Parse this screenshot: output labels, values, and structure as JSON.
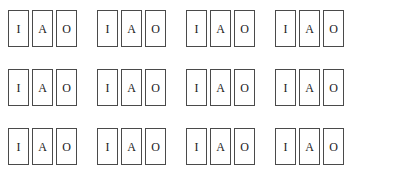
{
  "page": {
    "background_color": "#ffffff",
    "card_border_color": "#4a4a4a",
    "card_fill_color": "#ffffff",
    "letter_color": "#1a1a1a"
  },
  "grid": {
    "row_count": 3,
    "groups_per_row": 4,
    "cards_per_group": 3,
    "rows": [
      {
        "groups": [
          {
            "cards": [
              {
                "letter": "I"
              },
              {
                "letter": "A"
              },
              {
                "letter": "O"
              }
            ]
          },
          {
            "cards": [
              {
                "letter": "I"
              },
              {
                "letter": "A"
              },
              {
                "letter": "O"
              }
            ]
          },
          {
            "cards": [
              {
                "letter": "I"
              },
              {
                "letter": "A"
              },
              {
                "letter": "O"
              }
            ]
          },
          {
            "cards": [
              {
                "letter": "I"
              },
              {
                "letter": "A"
              },
              {
                "letter": "O"
              }
            ]
          }
        ]
      },
      {
        "groups": [
          {
            "cards": [
              {
                "letter": "I"
              },
              {
                "letter": "A"
              },
              {
                "letter": "O"
              }
            ]
          },
          {
            "cards": [
              {
                "letter": "I"
              },
              {
                "letter": "A"
              },
              {
                "letter": "O"
              }
            ]
          },
          {
            "cards": [
              {
                "letter": "I"
              },
              {
                "letter": "A"
              },
              {
                "letter": "O"
              }
            ]
          },
          {
            "cards": [
              {
                "letter": "I"
              },
              {
                "letter": "A"
              },
              {
                "letter": "O"
              }
            ]
          }
        ]
      },
      {
        "groups": [
          {
            "cards": [
              {
                "letter": "I"
              },
              {
                "letter": "A"
              },
              {
                "letter": "O"
              }
            ]
          },
          {
            "cards": [
              {
                "letter": "I"
              },
              {
                "letter": "A"
              },
              {
                "letter": "O"
              }
            ]
          },
          {
            "cards": [
              {
                "letter": "I"
              },
              {
                "letter": "A"
              },
              {
                "letter": "O"
              }
            ]
          },
          {
            "cards": [
              {
                "letter": "I"
              },
              {
                "letter": "A"
              },
              {
                "letter": "O"
              }
            ]
          }
        ]
      }
    ]
  }
}
